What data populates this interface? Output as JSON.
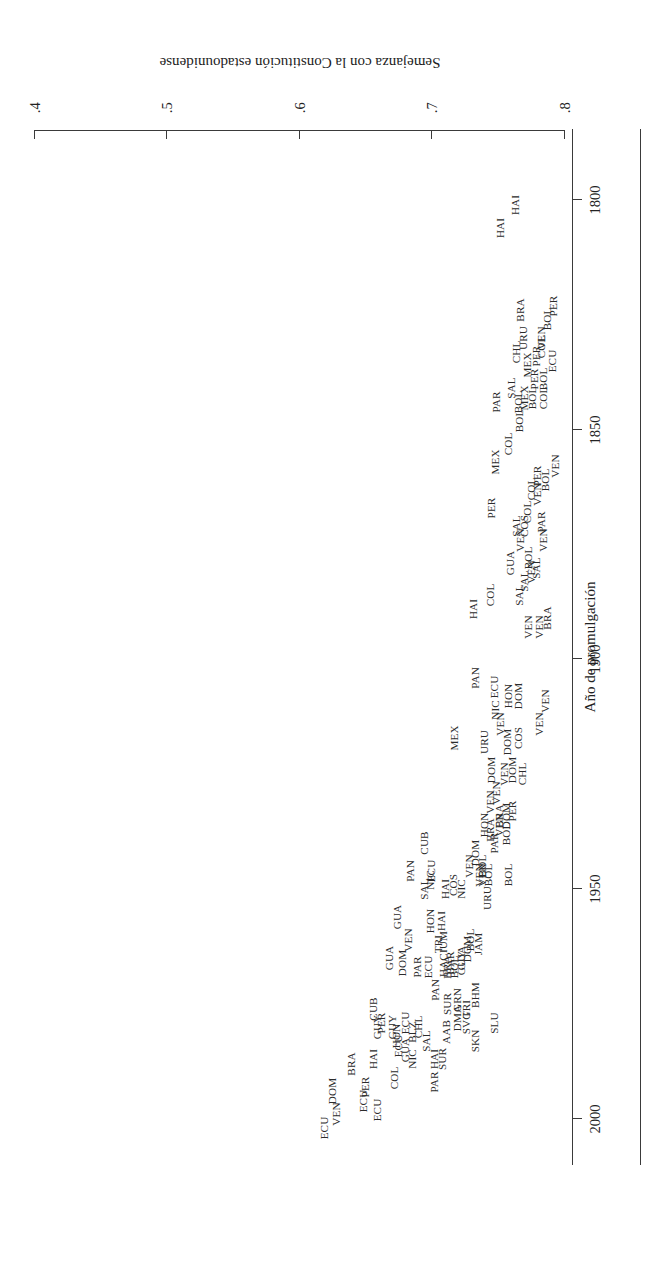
{
  "figure": {
    "orientation_note": "rotated-180",
    "xlabel": "Año de promulgación",
    "ylabel": "Semejanza con la Constitución estadounidense"
  },
  "chart_data": {
    "type": "scatter",
    "title": "",
    "xlabel": "Año de promulgación",
    "ylabel": "Semejanza con la Constitución estadounidense",
    "xlim": [
      1790,
      2010
    ],
    "ylim": [
      0.4,
      0.8
    ],
    "xticks": [
      1800,
      1850,
      1900,
      1950,
      2000
    ],
    "xticklabels": [
      "1800",
      "1850",
      "1900",
      "1950",
      "2000"
    ],
    "yticks": [
      0.4,
      0.5,
      0.6,
      0.7,
      0.8
    ],
    "yticklabels": [
      ".4",
      ".5",
      ".6",
      ".7",
      ".8"
    ],
    "grid": false,
    "legend": null,
    "marker_style": "text-label",
    "points": [
      {
        "label": "HAI",
        "x": 1801,
        "y": 0.763
      },
      {
        "label": "HAI",
        "x": 1806,
        "y": 0.752
      },
      {
        "label": "PER",
        "x": 1823,
        "y": 0.792
      },
      {
        "label": "BOL",
        "x": 1826,
        "y": 0.787
      },
      {
        "label": "VEN",
        "x": 1830,
        "y": 0.783
      },
      {
        "label": "URU",
        "x": 1830,
        "y": 0.769
      },
      {
        "label": "COL",
        "x": 1832,
        "y": 0.783
      },
      {
        "label": "ECU",
        "x": 1835,
        "y": 0.791
      },
      {
        "label": "PER",
        "x": 1834,
        "y": 0.779
      },
      {
        "label": "MEX",
        "x": 1836,
        "y": 0.772
      },
      {
        "label": "BRA",
        "x": 1824,
        "y": 0.767
      },
      {
        "label": "BOL",
        "x": 1839,
        "y": 0.784
      },
      {
        "label": "PER",
        "x": 1839,
        "y": 0.777
      },
      {
        "label": "BOL",
        "x": 1843,
        "y": 0.776
      },
      {
        "label": "MEX",
        "x": 1843,
        "y": 0.77
      },
      {
        "label": "COL",
        "x": 1843,
        "y": 0.784
      },
      {
        "label": "CHL",
        "x": 1833,
        "y": 0.764
      },
      {
        "label": "BOL",
        "x": 1844,
        "y": 0.765
      },
      {
        "label": "SAL",
        "x": 1841,
        "y": 0.76
      },
      {
        "label": "BOL",
        "x": 1848,
        "y": 0.766
      },
      {
        "label": "COL",
        "x": 1853,
        "y": 0.758
      },
      {
        "label": "PAR",
        "x": 1844,
        "y": 0.749
      },
      {
        "label": "VEN",
        "x": 1858,
        "y": 0.793
      },
      {
        "label": "BOL",
        "x": 1861,
        "y": 0.786
      },
      {
        "label": "PER",
        "x": 1860,
        "y": 0.78
      },
      {
        "label": "VEN",
        "x": 1864,
        "y": 0.78
      },
      {
        "label": "COL",
        "x": 1863,
        "y": 0.775
      },
      {
        "label": "COL",
        "x": 1868,
        "y": 0.772
      },
      {
        "label": "COS",
        "x": 1871,
        "y": 0.77
      },
      {
        "label": "VEN",
        "x": 1874,
        "y": 0.767
      },
      {
        "label": "SAL",
        "x": 1871,
        "y": 0.764
      },
      {
        "label": "MEX",
        "x": 1857,
        "y": 0.748
      },
      {
        "label": "PER",
        "x": 1867,
        "y": 0.745
      },
      {
        "label": "BOL",
        "x": 1878,
        "y": 0.773
      },
      {
        "label": "PAR",
        "x": 1870,
        "y": 0.783
      },
      {
        "label": "VEN",
        "x": 1874,
        "y": 0.784
      },
      {
        "label": "SAL",
        "x": 1880,
        "y": 0.779
      },
      {
        "label": "VEN",
        "x": 1881,
        "y": 0.775
      },
      {
        "label": "SAL",
        "x": 1883,
        "y": 0.77
      },
      {
        "label": "SAL",
        "x": 1886,
        "y": 0.766
      },
      {
        "label": "GUA",
        "x": 1879,
        "y": 0.759
      },
      {
        "label": "COL",
        "x": 1886,
        "y": 0.744
      },
      {
        "label": "BRA",
        "x": 1891,
        "y": 0.787
      },
      {
        "label": "VEN",
        "x": 1893,
        "y": 0.781
      },
      {
        "label": "VEN",
        "x": 1893,
        "y": 0.773
      },
      {
        "label": "HAI",
        "x": 1889,
        "y": 0.731
      },
      {
        "label": "VEN",
        "x": 1909,
        "y": 0.786
      },
      {
        "label": "VEN",
        "x": 1914,
        "y": 0.781
      },
      {
        "label": "DOM",
        "x": 1908,
        "y": 0.765
      },
      {
        "label": "HON",
        "x": 1908,
        "y": 0.758
      },
      {
        "label": "ECU",
        "x": 1906,
        "y": 0.747
      },
      {
        "label": "COS",
        "x": 1917,
        "y": 0.765
      },
      {
        "label": "DOM",
        "x": 1918,
        "y": 0.757
      },
      {
        "label": "VEN",
        "x": 1914,
        "y": 0.752
      },
      {
        "label": "NIC",
        "x": 1911,
        "y": 0.748
      },
      {
        "label": "DOM",
        "x": 1924,
        "y": 0.745
      },
      {
        "label": "PAN",
        "x": 1904,
        "y": 0.733
      },
      {
        "label": "CHL",
        "x": 1925,
        "y": 0.768
      },
      {
        "label": "DOM",
        "x": 1924,
        "y": 0.761
      },
      {
        "label": "VEN",
        "x": 1925,
        "y": 0.755
      },
      {
        "label": "VEN",
        "x": 1929,
        "y": 0.749
      },
      {
        "label": "URU",
        "x": 1918,
        "y": 0.74
      },
      {
        "label": "PER",
        "x": 1933,
        "y": 0.761
      },
      {
        "label": "DOM",
        "x": 1934,
        "y": 0.756
      },
      {
        "label": "VEN",
        "x": 1936,
        "y": 0.751
      },
      {
        "label": "VEN",
        "x": 1931,
        "y": 0.744
      },
      {
        "label": "MEX",
        "x": 1917,
        "y": 0.717
      },
      {
        "label": "BOL",
        "x": 1938,
        "y": 0.756
      },
      {
        "label": "BRA",
        "x": 1934,
        "y": 0.751
      },
      {
        "label": "BRA",
        "x": 1937,
        "y": 0.744
      },
      {
        "label": "HON",
        "x": 1936,
        "y": 0.74
      },
      {
        "label": "BOL",
        "x": 1945,
        "y": 0.738
      },
      {
        "label": "PAR",
        "x": 1940,
        "y": 0.747
      },
      {
        "label": "BOL",
        "x": 1947,
        "y": 0.743
      },
      {
        "label": "VEN",
        "x": 1947,
        "y": 0.738
      },
      {
        "label": "DOM",
        "x": 1942,
        "y": 0.733
      },
      {
        "label": "VEN",
        "x": 1945,
        "y": 0.728
      },
      {
        "label": "BOL",
        "x": 1947,
        "y": 0.758
      },
      {
        "label": "URU",
        "x": 1952,
        "y": 0.742
      },
      {
        "label": "VEN",
        "x": 1947,
        "y": 0.736
      },
      {
        "label": "JAM",
        "x": 1962,
        "y": 0.735
      },
      {
        "label": "BOL",
        "x": 1961,
        "y": 0.729
      },
      {
        "label": "DOM",
        "x": 1963,
        "y": 0.727
      },
      {
        "label": "GUA",
        "x": 1965,
        "y": 0.722
      },
      {
        "label": "NIC",
        "x": 1950,
        "y": 0.722
      },
      {
        "label": "GUY",
        "x": 1966,
        "y": 0.722
      },
      {
        "label": "BOL",
        "x": 1967,
        "y": 0.717
      },
      {
        "label": "COS",
        "x": 1949,
        "y": 0.716
      },
      {
        "label": "BAR",
        "x": 1966,
        "y": 0.714
      },
      {
        "label": "HAI",
        "x": 1950,
        "y": 0.71
      },
      {
        "label": "HAI",
        "x": 1957,
        "y": 0.707
      },
      {
        "label": "CUB",
        "x": 1940,
        "y": 0.694
      },
      {
        "label": "HACIUM",
        "x": 1964,
        "y": 0.709
      },
      {
        "label": "ECU",
        "x": 1946,
        "y": 0.7
      },
      {
        "label": "NIC",
        "x": 1948,
        "y": 0.699
      },
      {
        "label": "HON",
        "x": 1957,
        "y": 0.699
      },
      {
        "label": "TRI",
        "x": 1962,
        "y": 0.705
      },
      {
        "label": "SAL",
        "x": 1950,
        "y": 0.694
      },
      {
        "label": "ECU",
        "x": 1967,
        "y": 0.697
      },
      {
        "label": "PAN",
        "x": 1946,
        "y": 0.684
      },
      {
        "label": "PAR",
        "x": 1967,
        "y": 0.689
      },
      {
        "label": "GUA",
        "x": 1956,
        "y": 0.674
      },
      {
        "label": "GUA",
        "x": 1965,
        "y": 0.668
      },
      {
        "label": "DOM",
        "x": 1966,
        "y": 0.678
      },
      {
        "label": "VEN",
        "x": 1961,
        "y": 0.682
      },
      {
        "label": "ECU",
        "x": 1979,
        "y": 0.68
      },
      {
        "label": "GUY",
        "x": 1980,
        "y": 0.67
      },
      {
        "label": "SLU",
        "x": 1979,
        "y": 0.747
      },
      {
        "label": "BHM",
        "x": 1973,
        "y": 0.733
      },
      {
        "label": "SKN",
        "x": 1983,
        "y": 0.733
      },
      {
        "label": "TRI",
        "x": 1976,
        "y": 0.726
      },
      {
        "label": "SVG",
        "x": 1979,
        "y": 0.726
      },
      {
        "label": "GRN",
        "x": 1974,
        "y": 0.719
      },
      {
        "label": "DMA",
        "x": 1978,
        "y": 0.719
      },
      {
        "label": "BRA",
        "x": 1967,
        "y": 0.712
      },
      {
        "label": "SUR",
        "x": 1975,
        "y": 0.712
      },
      {
        "label": "AAB",
        "x": 1981,
        "y": 0.711
      },
      {
        "label": "SUR",
        "x": 1987,
        "y": 0.708
      },
      {
        "label": "PAN",
        "x": 1972,
        "y": 0.703
      },
      {
        "label": "HAI",
        "x": 1987,
        "y": 0.702
      },
      {
        "label": "PAR",
        "x": 1992,
        "y": 0.702
      },
      {
        "label": "SAL",
        "x": 1983,
        "y": 0.696
      },
      {
        "label": "CHL",
        "x": 1980,
        "y": 0.69
      },
      {
        "label": "BLZ",
        "x": 1981,
        "y": 0.685
      },
      {
        "label": "NIC",
        "x": 1987,
        "y": 0.685
      },
      {
        "label": "GUA",
        "x": 1985,
        "y": 0.68
      },
      {
        "label": "ECU",
        "x": 1984,
        "y": 0.675
      },
      {
        "label": "HON",
        "x": 1982,
        "y": 0.673
      },
      {
        "label": "COL",
        "x": 1991,
        "y": 0.672
      },
      {
        "label": "PER",
        "x": 1979,
        "y": 0.662
      },
      {
        "label": "CUB",
        "x": 1976,
        "y": 0.656
      },
      {
        "label": "GUY",
        "x": 1980,
        "y": 0.659
      },
      {
        "label": "HAI",
        "x": 1987,
        "y": 0.656
      },
      {
        "label": "ECU",
        "x": 1998,
        "y": 0.659
      },
      {
        "label": "PER",
        "x": 1993,
        "y": 0.65
      },
      {
        "label": "ECU",
        "x": 1996,
        "y": 0.648
      },
      {
        "label": "BRA",
        "x": 1988,
        "y": 0.639
      },
      {
        "label": "DOM",
        "x": 1994,
        "y": 0.625
      },
      {
        "label": "VEN",
        "x": 1999,
        "y": 0.628
      },
      {
        "label": "ECU",
        "x": 2002,
        "y": 0.619
      }
    ]
  }
}
